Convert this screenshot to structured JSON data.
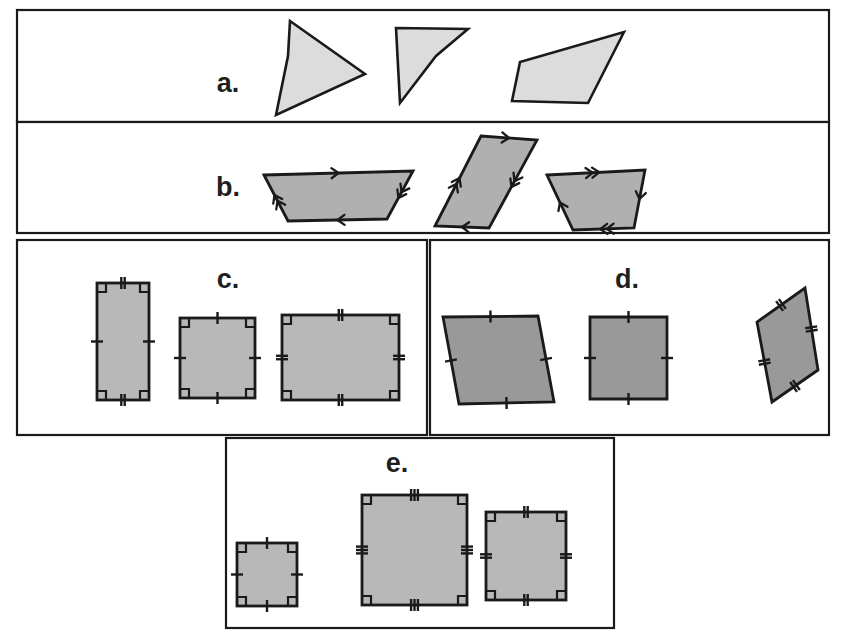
{
  "figure": {
    "background_color": "#ffffff",
    "border_color": "#1a1a1a"
  },
  "panels": [
    {
      "id": "a",
      "label": "a.",
      "label_x": 228,
      "label_y": 92,
      "category": "general-quadrilaterals",
      "box": {
        "x": 17,
        "y": 10,
        "w": 812,
        "h": 112
      },
      "fill": "#dcdcdc",
      "shapes": [
        {
          "name": "quadrilateral-1",
          "points": "290,21 365,74 276,115 288,56"
        },
        {
          "name": "quadrilateral-2-concave",
          "points": "396,28 468,29 436,56 400,103"
        },
        {
          "name": "quadrilateral-3",
          "points": "624,32 588,103 512,101 520,62"
        }
      ]
    },
    {
      "id": "b",
      "label": "b.",
      "label_x": 228,
      "label_y": 196,
      "category": "parallelograms",
      "box": {
        "x": 17,
        "y": 122,
        "w": 812,
        "h": 111
      },
      "fill": "#b0b0b0",
      "shapes": [
        {
          "name": "parallelogram-1",
          "points": "264,175 413,171 387,219 288,221",
          "marks": {
            "top": 1,
            "bottom": 1,
            "left": 2,
            "right": 2
          }
        },
        {
          "name": "parallelogram-2",
          "points": "481,136 537,140 489,228 435,226",
          "marks": {
            "top": 1,
            "bottom": 1,
            "left": 2,
            "right": 2
          }
        },
        {
          "name": "parallelogram-3",
          "points": "547,175 645,170 634,228 573,230",
          "marks": {
            "top": 2,
            "bottom": 2,
            "left": 1,
            "right": 1
          }
        }
      ]
    },
    {
      "id": "c",
      "label": "c.",
      "label_x": 228,
      "label_y": 288,
      "category": "rectangles",
      "box": {
        "x": 17,
        "y": 240,
        "w": 410,
        "h": 195
      },
      "fill": "#b8b8b8",
      "shapes": [
        {
          "name": "rectangle-tall",
          "x": 97,
          "y": 283,
          "w": 52,
          "h": 117,
          "marks": {
            "top": 2,
            "bottom": 2,
            "left": 1,
            "right": 1
          }
        },
        {
          "name": "rectangle-square-like",
          "x": 180,
          "y": 318,
          "w": 75,
          "h": 80,
          "marks": {
            "top": 1,
            "bottom": 1,
            "left": 1,
            "right": 1
          }
        },
        {
          "name": "rectangle-wide",
          "x": 282,
          "y": 315,
          "w": 117,
          "h": 85,
          "marks": {
            "top": 2,
            "bottom": 2,
            "left": 2,
            "right": 2
          }
        }
      ]
    },
    {
      "id": "d",
      "label": "d.",
      "label_x": 627,
      "label_y": 288,
      "category": "rhombuses",
      "box": {
        "x": 430,
        "y": 240,
        "w": 399,
        "h": 195
      },
      "fill": "#999999",
      "shapes": [
        {
          "name": "rhombus-slanted-left",
          "points": "443,317 538,316 554,402 459,404",
          "marks": {
            "top": 1,
            "bottom": 1,
            "left": 1,
            "right": 1
          }
        },
        {
          "name": "rhombus-upright",
          "points": "590,317 667,317 667,399 590,399",
          "marks": {
            "top": 1,
            "bottom": 1,
            "left": 1,
            "right": 1
          }
        },
        {
          "name": "rhombus-steep",
          "points": "805,288 818,370 772,402 757,322",
          "marks": {
            "top": 2,
            "bottom": 2,
            "left": 2,
            "right": 2
          }
        }
      ]
    },
    {
      "id": "e",
      "label": "e.",
      "label_x": 397,
      "label_y": 472,
      "category": "squares",
      "box": {
        "x": 226,
        "y": 438,
        "w": 388,
        "h": 190
      },
      "fill": "#b8b8b8",
      "shapes": [
        {
          "name": "square-small",
          "x": 237,
          "y": 543,
          "w": 60,
          "h": 63,
          "marks": {
            "top": 1,
            "bottom": 1,
            "left": 1,
            "right": 1
          }
        },
        {
          "name": "square-large",
          "x": 362,
          "y": 495,
          "w": 105,
          "h": 110,
          "marks": {
            "top": 3,
            "bottom": 3,
            "left": 3,
            "right": 3
          }
        },
        {
          "name": "square-medium",
          "x": 486,
          "y": 512,
          "w": 80,
          "h": 88,
          "marks": {
            "top": 2,
            "bottom": 2,
            "left": 2,
            "right": 2
          }
        }
      ]
    }
  ],
  "legend_notes": {
    "tick_marks": "Short hash marks across a side denote congruent side lengths.",
    "arrow_marks": "Arrowheads on a side denote pairs of parallel sides.",
    "right_angle_marks": "Small squares at a vertex denote 90 degree angles."
  }
}
